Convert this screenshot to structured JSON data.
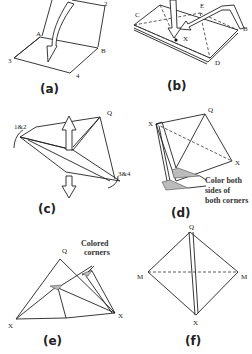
{
  "figure": {
    "panels": [
      {
        "id": "a",
        "caption": "(a)",
        "points": {
          "a": "A",
          "b": "B",
          "p2": "2",
          "p3": "3",
          "p4": "4"
        }
      },
      {
        "id": "b",
        "caption": "(b)",
        "points": {
          "c": "C",
          "e": "E",
          "x": "X",
          "b": "B",
          "d": "D"
        }
      },
      {
        "id": "c",
        "caption": "(c)",
        "points": {
          "p12": "1&2",
          "q": "Q",
          "p34": "3&4"
        }
      },
      {
        "id": "d",
        "caption": "(d)",
        "points": {
          "x1": "X",
          "q": "Q",
          "x2": "X"
        },
        "note": [
          "Color both",
          "sides of",
          "both corners"
        ]
      },
      {
        "id": "e",
        "caption": "(e)",
        "points": {
          "q": "Q",
          "x1": "X",
          "x2": "X"
        },
        "note": [
          "Colored",
          "corners"
        ]
      },
      {
        "id": "f",
        "caption": "(f)",
        "points": {
          "q": "Q",
          "m1": "M",
          "m2": "M",
          "x": "X"
        }
      }
    ]
  }
}
